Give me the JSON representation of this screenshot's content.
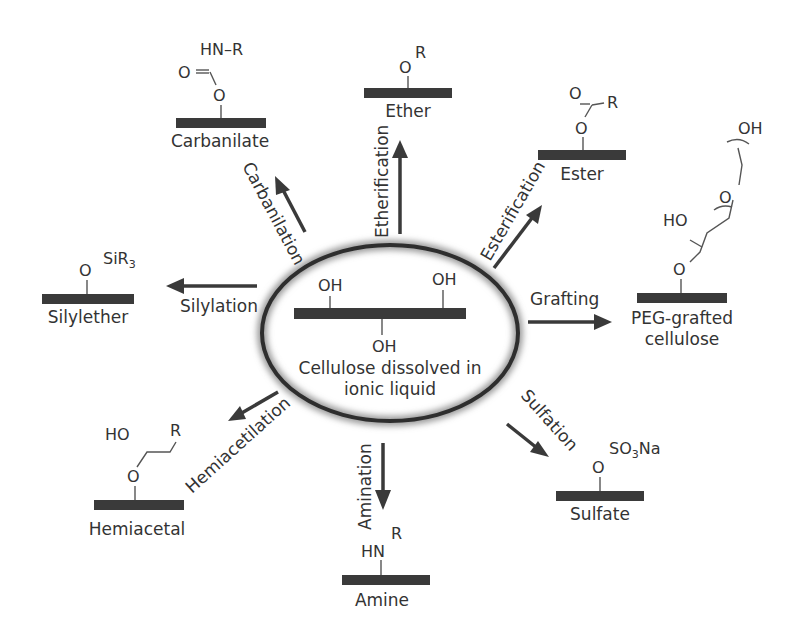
{
  "center": {
    "line1": "Cellulose dissolved in",
    "line2": "ionic liquid",
    "oh_left": "OH",
    "oh_right": "OH",
    "oh_bottom": "OH"
  },
  "reactions": [
    {
      "id": "carbanilation",
      "label": "Carbanilation",
      "product": "Carbanilate",
      "groups": [
        "HN–R",
        "O",
        "O"
      ]
    },
    {
      "id": "etherification",
      "label": "Etherification",
      "product": "Ether",
      "groups": [
        "O",
        "R"
      ]
    },
    {
      "id": "esterification",
      "label": "Esterification",
      "product": "Ester",
      "groups": [
        "O",
        "R",
        "O"
      ]
    },
    {
      "id": "grafting",
      "label": "Grafting",
      "product_line1": "PEG-grafted",
      "product_line2": "cellulose",
      "groups": [
        "OH",
        "O",
        "HO",
        "O"
      ]
    },
    {
      "id": "silylation",
      "label": "Silylation",
      "product": "Silylether",
      "groups": [
        "O",
        "SiR",
        "3"
      ]
    },
    {
      "id": "hemiacetilation",
      "label": "Hemiacetilation",
      "product": "Hemiacetal",
      "groups": [
        "HO",
        "R",
        "O"
      ]
    },
    {
      "id": "amination",
      "label": "Amination",
      "product": "Amine",
      "groups": [
        "HN",
        "R"
      ]
    },
    {
      "id": "sulfation",
      "label": "Sulfation",
      "product": "Sulfate",
      "groups": [
        "O",
        "SO",
        "3",
        "Na"
      ]
    }
  ]
}
